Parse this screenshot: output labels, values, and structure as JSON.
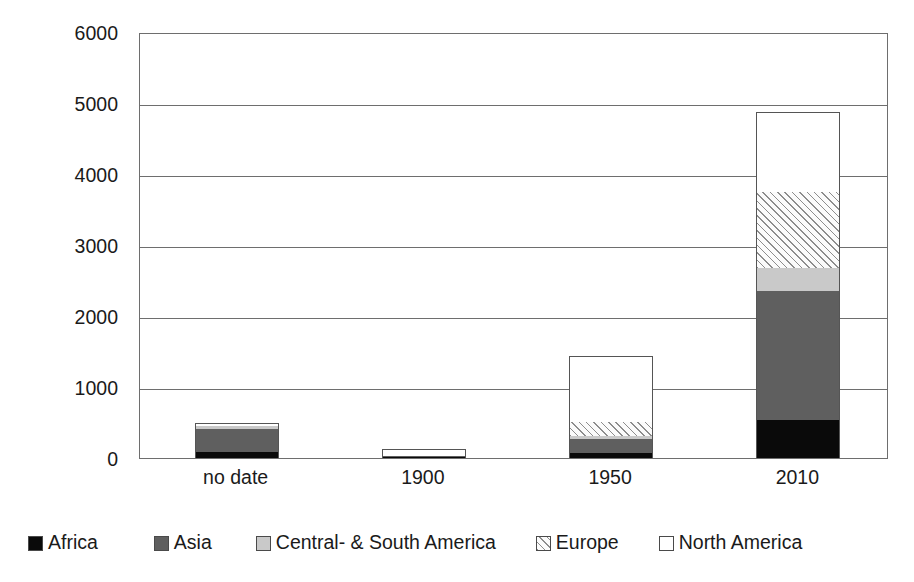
{
  "chart_data": {
    "type": "bar",
    "subtype": "stacked-vertical",
    "title": "",
    "xlabel": "",
    "ylabel": "Number of dams",
    "ylim": [
      0,
      6000
    ],
    "ytick_step": 1000,
    "yticks": [
      "6000",
      "5000",
      "4000",
      "3000",
      "2000",
      "1000",
      "0"
    ],
    "ytick_values": [
      6000,
      5000,
      4000,
      3000,
      2000,
      1000,
      0
    ],
    "grid": "horizontal",
    "legend_position": "bottom",
    "categories": [
      "no date",
      "1900",
      "1950",
      "2010"
    ],
    "series": [
      {
        "name": "Africa",
        "color": "#0a0a0a",
        "pattern": "solid",
        "values": [
          85,
          15,
          75,
          530
        ]
      },
      {
        "name": "Asia",
        "color": "#5f5f5f",
        "pattern": "solid",
        "values": [
          330,
          10,
          190,
          1820
        ]
      },
      {
        "name": "Central- & South America",
        "color": "#c9c9c9",
        "pattern": "solid",
        "values": [
          40,
          5,
          45,
          330
        ]
      },
      {
        "name": "Europe",
        "color": "#fbfbfb",
        "pattern": "diagonal-hatch",
        "values": [
          0,
          5,
          200,
          1070
        ]
      },
      {
        "name": "North America",
        "color": "#ffffff",
        "pattern": "solid",
        "values": [
          35,
          90,
          925,
          1125
        ]
      }
    ],
    "totals": [
      490,
      125,
      1435,
      4875
    ]
  },
  "axes": {
    "y_title": "Number of dams"
  },
  "legend": {
    "items": [
      {
        "label": "Africa",
        "swatch": "legend-swatch-africa"
      },
      {
        "label": "Asia",
        "swatch": "legend-swatch-asia"
      },
      {
        "label": "Central- & South America",
        "swatch": "legend-swatch-central-south-america"
      },
      {
        "label": "Europe",
        "swatch": "legend-swatch-europe"
      },
      {
        "label": "North America",
        "swatch": "legend-swatch-north-america"
      }
    ]
  }
}
